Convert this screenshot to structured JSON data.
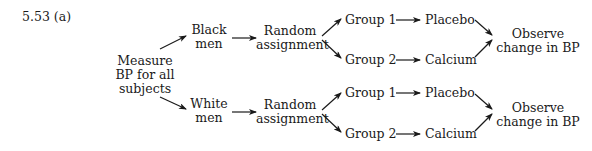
{
  "problem_label": "5.53 (a)",
  "start_node": {
    "lines": [
      "Measure",
      "BP for all",
      "subjects"
    ]
  },
  "branches": [
    {
      "block": {
        "lines": [
          "Black",
          "men"
        ]
      },
      "assignment": {
        "lines": [
          "Random",
          "assignment"
        ]
      },
      "groups": [
        {
          "label": "Group 1",
          "treatment": "Placebo"
        },
        {
          "label": "Group 2",
          "treatment": "Calcium"
        }
      ],
      "outcome": {
        "lines": [
          "Observe",
          "change in BP"
        ]
      }
    },
    {
      "block": {
        "lines": [
          "White",
          "men"
        ]
      },
      "assignment": {
        "lines": [
          "Random",
          "assignment"
        ]
      },
      "groups": [
        {
          "label": "Group 1",
          "treatment": "Placebo"
        },
        {
          "label": "Group 2",
          "treatment": "Calcium"
        }
      ],
      "outcome": {
        "lines": [
          "Observe",
          "change in BP"
        ]
      }
    }
  ],
  "colors": {
    "ink": "#1a1a1a",
    "background": "#ffffff"
  }
}
